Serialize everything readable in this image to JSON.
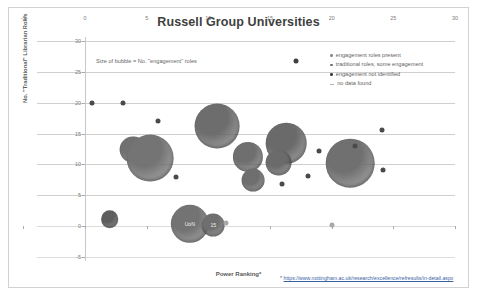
{
  "header": {
    "title": "Russell Group Universities"
  },
  "annotation": {
    "bubble_note": "Size of bubble = No. \"engagement\" roles"
  },
  "legend": {
    "position": "top-right",
    "items": [
      {
        "label": "engagement  roles present",
        "color": "#8c8c8c",
        "marker": "dot"
      },
      {
        "label": "traditional roles, some engagement",
        "color": "#6e6e6e",
        "marker": "dot"
      },
      {
        "label": "engagement  not identified",
        "color": "#3f3f3f",
        "marker": "dot"
      },
      {
        "label": "no data found",
        "color": "#b4b4b4",
        "marker": "dash"
      }
    ]
  },
  "footnote": {
    "star": "*",
    "url": "https://www.nottingham.ac.uk/research/excellence/refresults/in-detail.aspx"
  },
  "chart_data": {
    "type": "scatter",
    "title": "Russell Group Universities",
    "xlabel": "Power Ranking*",
    "ylabel": "No. \"Traditional\" Librarian Roles",
    "xlim": [
      -5,
      30
    ],
    "ylim": [
      -5,
      30
    ],
    "xticks": [
      -5,
      0,
      5,
      10,
      15,
      20,
      25,
      30
    ],
    "yticks": [
      -5,
      0,
      5,
      10,
      15,
      20,
      25,
      30
    ],
    "grid": true,
    "size_encoding": "Size of bubble = No. \"engagement\" roles",
    "points": [
      {
        "x": 0.6,
        "y": 20,
        "size": 1,
        "color": "#4a4a4a",
        "label": ""
      },
      {
        "x": 3.1,
        "y": 20,
        "size": 1,
        "color": "#4a4a4a",
        "label": ""
      },
      {
        "x": 5.9,
        "y": 17,
        "size": 1,
        "color": "#4a4a4a",
        "label": ""
      },
      {
        "x": 10.7,
        "y": 16.2,
        "size": 11,
        "color": "#6d6d6d",
        "label": ""
      },
      {
        "x": 3.9,
        "y": 12.4,
        "size": 4,
        "color": "#717171",
        "label": ""
      },
      {
        "x": 5.3,
        "y": 11.0,
        "size": 12,
        "color": "#747474",
        "label": ""
      },
      {
        "x": 16.3,
        "y": 13.4,
        "size": 9,
        "color": "#6a6a6a",
        "label": ""
      },
      {
        "x": 13.2,
        "y": 11.2,
        "size": 5,
        "color": "#6f6f6f",
        "label": ""
      },
      {
        "x": 15.7,
        "y": 10.3,
        "size": 4,
        "color": "#6b6b6b",
        "label": ""
      },
      {
        "x": 21.5,
        "y": 10.2,
        "size": 13,
        "color": "#707070",
        "label": ""
      },
      {
        "x": 7.4,
        "y": 7.9,
        "size": 1,
        "color": "#4a4a4a",
        "label": ""
      },
      {
        "x": 13.6,
        "y": 7.4,
        "size": 3,
        "color": "#6e6e6e",
        "label": ""
      },
      {
        "x": 24.1,
        "y": 15.6,
        "size": 1,
        "color": "#4a4a4a",
        "label": ""
      },
      {
        "x": 21.9,
        "y": 13.0,
        "size": 1,
        "color": "#4a4a4a",
        "label": ""
      },
      {
        "x": 19.0,
        "y": 12.1,
        "size": 1,
        "color": "#4a4a4a",
        "label": ""
      },
      {
        "x": 24.2,
        "y": 9.1,
        "size": 1,
        "color": "#4a4a4a",
        "label": ""
      },
      {
        "x": 18.1,
        "y": 8.1,
        "size": 1,
        "color": "#4a4a4a",
        "label": ""
      },
      {
        "x": 16.0,
        "y": 6.8,
        "size": 1,
        "color": "#4a4a4a",
        "label": ""
      },
      {
        "x": 17.1,
        "y": 26.8,
        "size": 1,
        "color": "#3f3f3f",
        "label": ""
      },
      {
        "x": 2.0,
        "y": 1.1,
        "size": 2,
        "color": "#5e5e5e",
        "label": ""
      },
      {
        "x": 8.5,
        "y": 0.4,
        "size": 8,
        "color": "#737373",
        "label": "UoN"
      },
      {
        "x": 10.4,
        "y": 0.2,
        "size": 3,
        "color": "#6f6f6f",
        "label": "15"
      },
      {
        "x": 11.4,
        "y": 0.5,
        "size": 1,
        "color": "#a8a8a8",
        "label": ""
      },
      {
        "x": 20.0,
        "y": 0.2,
        "size": 1,
        "color": "#a8a8a8",
        "label": ""
      }
    ]
  }
}
